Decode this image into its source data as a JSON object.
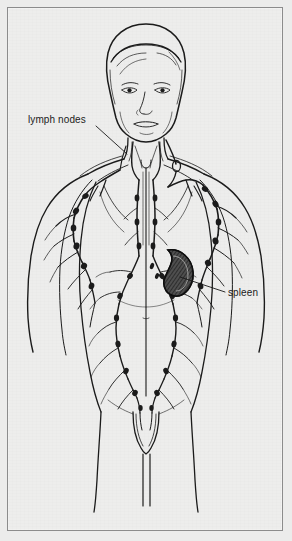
{
  "figure": {
    "style": "black ink line drawing on off-white paper with thin rectangular border",
    "background_color": "#ededec",
    "ink_color": "#1b1b1b",
    "border_color": "#8c8c8c",
    "width": 292,
    "height": 541
  },
  "labels": {
    "lymph_nodes": "lymph nodes",
    "spleen": "spleen"
  },
  "callouts": [
    {
      "name": "lymph-nodes-callout",
      "text": "lymph nodes",
      "label_position": {
        "x": 28,
        "y": 114
      },
      "leader_from": {
        "x": 96,
        "y": 126
      },
      "leader_to": {
        "x": 125,
        "y": 152
      }
    },
    {
      "name": "spleen-callout",
      "text": "spleen",
      "label_position": {
        "x": 228,
        "y": 287
      },
      "leader_from": {
        "x": 224,
        "y": 291
      },
      "leader_to": {
        "x": 180,
        "y": 277
      }
    }
  ],
  "anatomy": {
    "organs": [
      {
        "name": "spleen",
        "shape": "kidney-bean",
        "fill": "dark hatched",
        "center": {
          "x": 176,
          "y": 272
        }
      }
    ],
    "regions": [
      "head",
      "face",
      "neck",
      "shoulders",
      "chest",
      "arms",
      "abdomen",
      "groin",
      "legs"
    ],
    "lymph_chains": [
      "cervical",
      "axillary",
      "thoracic-midline",
      "abdominal",
      "inguinal",
      "upper-arm"
    ]
  }
}
